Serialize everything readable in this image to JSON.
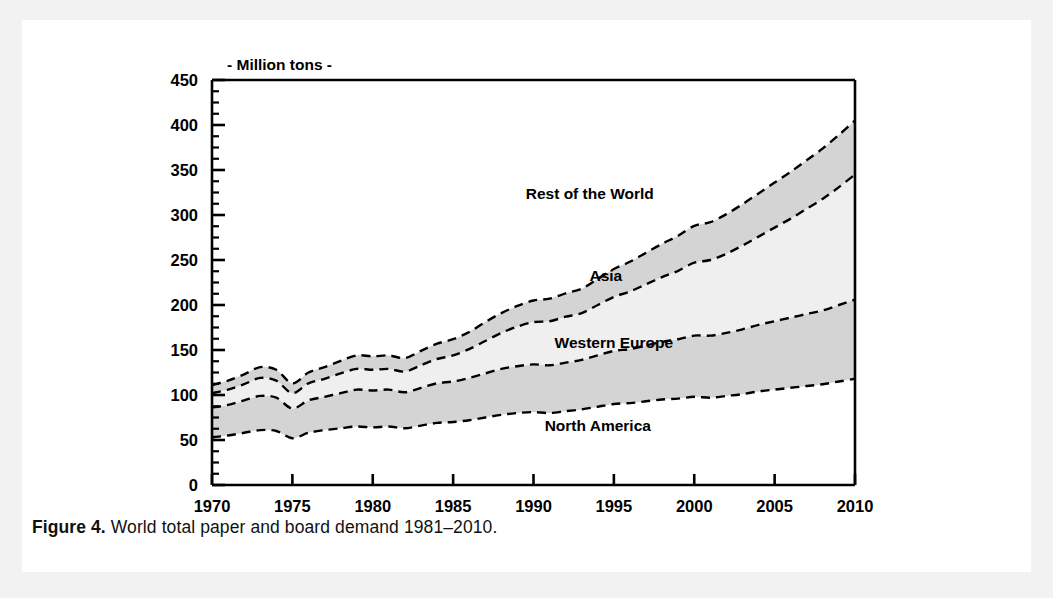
{
  "figure": {
    "caption_number": "Figure 4.",
    "caption_text": " World total paper and board demand 1981–2010.",
    "unit_label": "- Million tons -"
  },
  "colors": {
    "page_frame": "#f2f2f2",
    "panel_background": "#ffffff",
    "axis": "#000000",
    "band_shaded": "#d4d4d4",
    "band_light": "#efefef",
    "band_white": "#ffffff",
    "curve": "#000000",
    "text": "#000000"
  },
  "chart_data": {
    "type": "area",
    "stacked": true,
    "title": "",
    "subtitle": "",
    "xlabel": "",
    "ylabel": "- Million tons -",
    "xlim": [
      1970,
      2010
    ],
    "ylim": [
      0,
      450
    ],
    "xticks": [
      1970,
      1975,
      1980,
      1985,
      1990,
      1995,
      2000,
      2005,
      2010
    ],
    "xticklabels": [
      "1970",
      "1975",
      "1980",
      "1985",
      "1990",
      "1995",
      "2000",
      "2005",
      "2010"
    ],
    "yticks": [
      0,
      50,
      100,
      150,
      200,
      250,
      300,
      350,
      400,
      450
    ],
    "yticklabels": [
      "0",
      "50",
      "100",
      "150",
      "200",
      "250",
      "300",
      "350",
      "400",
      "450"
    ],
    "y_minor_tick_step": 12.5,
    "grid": false,
    "legend_position": "inline-annotations",
    "x": [
      1970,
      1971,
      1972,
      1973,
      1974,
      1975,
      1976,
      1977,
      1978,
      1979,
      1980,
      1981,
      1982,
      1983,
      1984,
      1985,
      1986,
      1987,
      1988,
      1989,
      1990,
      1991,
      1992,
      1993,
      1994,
      1995,
      1996,
      1997,
      1998,
      1999,
      2000,
      2001,
      2002,
      2003,
      2004,
      2005,
      2006,
      2007,
      2008,
      2009,
      2010
    ],
    "series": [
      {
        "name": "North America",
        "fill": "white",
        "values": [
          53,
          55,
          58,
          61,
          60,
          52,
          58,
          61,
          63,
          65,
          64,
          65,
          63,
          66,
          69,
          70,
          72,
          75,
          78,
          80,
          81,
          80,
          82,
          84,
          87,
          90,
          91,
          93,
          95,
          96,
          98,
          97,
          99,
          101,
          104,
          106,
          108,
          110,
          112,
          115,
          118
        ]
      },
      {
        "name": "Western Europe",
        "fill": "shaded",
        "values": [
          33,
          34,
          36,
          38,
          37,
          33,
          36,
          37,
          39,
          41,
          41,
          41,
          40,
          42,
          44,
          45,
          47,
          49,
          51,
          52,
          53,
          53,
          54,
          55,
          57,
          59,
          60,
          62,
          64,
          66,
          68,
          69,
          70,
          72,
          74,
          76,
          78,
          80,
          82,
          85,
          88
        ]
      },
      {
        "name": "Asia",
        "fill": "light",
        "values": [
          16,
          17,
          18,
          20,
          19,
          17,
          19,
          20,
          22,
          23,
          23,
          23,
          23,
          25,
          27,
          29,
          32,
          36,
          40,
          44,
          47,
          49,
          51,
          52,
          56,
          60,
          64,
          68,
          72,
          76,
          81,
          84,
          88,
          93,
          98,
          104,
          110,
          117,
          124,
          131,
          139
        ]
      },
      {
        "name": "Rest of the World",
        "fill": "shaded",
        "values": [
          9,
          10,
          11,
          12,
          12,
          11,
          12,
          13,
          14,
          15,
          15,
          15,
          15,
          16,
          17,
          18,
          19,
          21,
          22,
          23,
          24,
          25,
          26,
          27,
          29,
          31,
          33,
          35,
          37,
          39,
          41,
          42,
          44,
          46,
          48,
          50,
          52,
          54,
          56,
          58,
          60
        ]
      }
    ],
    "cumulative_totals": {
      "name": "World total",
      "values": [
        111,
        116,
        123,
        131,
        128,
        113,
        125,
        131,
        138,
        144,
        143,
        144,
        141,
        149,
        157,
        162,
        170,
        181,
        191,
        199,
        205,
        207,
        213,
        218,
        229,
        240,
        248,
        258,
        268,
        277,
        288,
        292,
        301,
        312,
        324,
        336,
        348,
        361,
        374,
        389,
        405
      ]
    },
    "annotations": [
      {
        "label": "Rest of the World",
        "x": 1993.5,
        "y": 318
      },
      {
        "label": "Asia",
        "x": 1994.5,
        "y": 227
      },
      {
        "label": "Western Europe",
        "x": 1995.0,
        "y": 152
      },
      {
        "label": "North America",
        "x": 1994.0,
        "y": 60
      }
    ]
  }
}
